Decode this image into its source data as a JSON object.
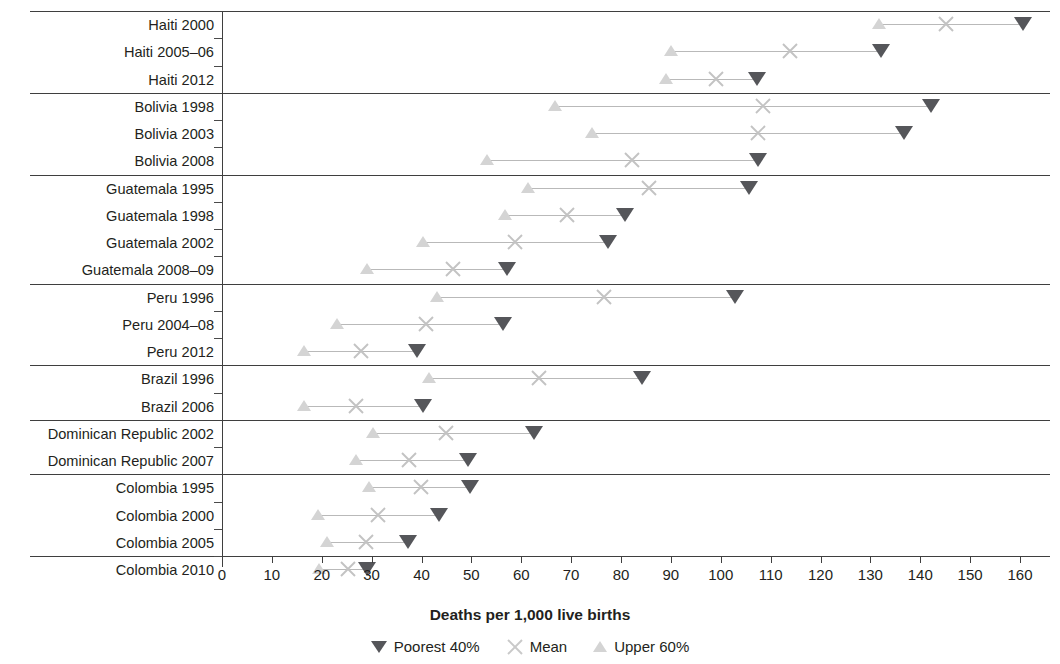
{
  "chart_data": {
    "type": "scatter",
    "title": "",
    "xlabel": "Deaths per 1,000 live births",
    "ylabel": "",
    "xlim": [
      0,
      160
    ],
    "xticks": [
      0,
      10,
      20,
      30,
      40,
      50,
      60,
      70,
      80,
      90,
      100,
      110,
      120,
      130,
      140,
      150,
      160
    ],
    "grid": false,
    "legend_position": "bottom",
    "orientation": "horizontal",
    "series": [
      {
        "name": "Poorest 40%",
        "marker": "triangle-down",
        "color": "#55565a"
      },
      {
        "name": "Mean",
        "marker": "x",
        "color": "#c3c3c3"
      },
      {
        "name": "Upper 60%",
        "marker": "triangle-up",
        "color": "#d4d4d4"
      }
    ],
    "groups": [
      {
        "country": "Haiti",
        "rows": [
          {
            "category": "Haiti 2000",
            "upper60": 131.8,
            "mean": 145.2,
            "poorest40": 160.6
          },
          {
            "category": "Haiti 2005–06",
            "upper60": 90.0,
            "mean": 113.9,
            "poorest40": 132.1
          },
          {
            "category": "Haiti 2012",
            "upper60": 89.0,
            "mean": 99.0,
            "poorest40": 107.3
          }
        ]
      },
      {
        "country": "Bolivia",
        "rows": [
          {
            "category": "Bolivia 1998",
            "upper60": 66.8,
            "mean": 108.5,
            "poorest40": 142.2
          },
          {
            "category": "Bolivia 2003",
            "upper60": 74.2,
            "mean": 107.5,
            "poorest40": 136.8
          },
          {
            "category": "Bolivia 2008",
            "upper60": 53.1,
            "mean": 82.2,
            "poorest40": 107.5
          }
        ]
      },
      {
        "country": "Guatemala",
        "rows": [
          {
            "category": "Guatemala 1995",
            "upper60": 61.4,
            "mean": 85.6,
            "poorest40": 105.7
          },
          {
            "category": "Guatemala 1998",
            "upper60": 56.7,
            "mean": 69.2,
            "poorest40": 80.8
          },
          {
            "category": "Guatemala 2002",
            "upper60": 40.3,
            "mean": 58.8,
            "poorest40": 77.4
          },
          {
            "category": "Guatemala 2008–09",
            "upper60": 29.1,
            "mean": 46.3,
            "poorest40": 57.1
          }
        ]
      },
      {
        "country": "Peru",
        "rows": [
          {
            "category": "Peru 1996",
            "upper60": 43.1,
            "mean": 76.6,
            "poorest40": 102.9
          },
          {
            "category": "Peru 2004–08",
            "upper60": 23.1,
            "mean": 40.9,
            "poorest40": 56.3
          },
          {
            "category": "Peru 2012",
            "upper60": 16.4,
            "mean": 27.9,
            "poorest40": 39.1
          }
        ]
      },
      {
        "country": "Brazil",
        "rows": [
          {
            "category": "Brazil 1996",
            "upper60": 41.5,
            "mean": 63.6,
            "poorest40": 84.2
          },
          {
            "category": "Brazil 2006",
            "upper60": 16.4,
            "mean": 26.9,
            "poorest40": 40.3
          }
        ]
      },
      {
        "country": "Dominican Republic",
        "rows": [
          {
            "category": "Dominican Republic 2002",
            "upper60": 30.3,
            "mean": 44.9,
            "poorest40": 62.6
          },
          {
            "category": "Dominican Republic 2007",
            "upper60": 26.9,
            "mean": 37.5,
            "poorest40": 49.3
          }
        ]
      },
      {
        "country": "Colombia",
        "rows": [
          {
            "category": "Colombia 1995",
            "upper60": 29.5,
            "mean": 39.9,
            "poorest40": 49.7
          },
          {
            "category": "Colombia 2000",
            "upper60": 19.2,
            "mean": 31.3,
            "poorest40": 43.5
          },
          {
            "category": "Colombia 2005",
            "upper60": 21.1,
            "mean": 28.9,
            "poorest40": 37.3
          },
          {
            "category": "Colombia 2010",
            "upper60": 19.4,
            "mean": 25.3,
            "poorest40": 29.1
          }
        ]
      }
    ]
  },
  "legend": {
    "items": [
      {
        "label": "Poorest 40%",
        "icon": "triangle-down-icon"
      },
      {
        "label": "Mean",
        "icon": "x-icon"
      },
      {
        "label": "Upper 60%",
        "icon": "triangle-up-icon"
      }
    ]
  },
  "axis": {
    "x_title": "Deaths per 1,000 live births"
  }
}
